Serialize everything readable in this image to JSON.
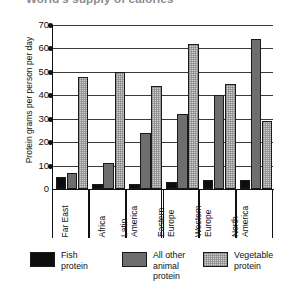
{
  "chart_data": {
    "type": "bar",
    "title": "World's supply of calories",
    "xlabel": "",
    "ylabel": "Protein grams per person per day",
    "ylim": [
      0,
      70
    ],
    "yticks": [
      0,
      10,
      20,
      30,
      40,
      50,
      60,
      70
    ],
    "grid": true,
    "legend_position": "bottom",
    "categories": [
      "Far East",
      "Africa",
      "Latin America",
      "Eastern Europe",
      "Western Europe",
      "North America"
    ],
    "category_lines": [
      [
        "Far East"
      ],
      [
        "Africa"
      ],
      [
        "Latin",
        "America"
      ],
      [
        "Eastern",
        "Europe"
      ],
      [
        "Western",
        "Europe"
      ],
      [
        "North",
        "America"
      ]
    ],
    "series": [
      {
        "name": "Fish protein",
        "name_lines": [
          "Fish",
          "protein"
        ],
        "color": "#0d0d0d",
        "values": [
          5,
          2,
          2,
          3,
          4,
          4
        ]
      },
      {
        "name": "All other animal protein",
        "name_lines": [
          "All other",
          "animal",
          "protein"
        ],
        "color": "#6e6e6e",
        "values": [
          7,
          11,
          24,
          32,
          40,
          64
        ]
      },
      {
        "name": "Vegetable protein",
        "name_lines": [
          "Vegetable",
          "protein"
        ],
        "color": "#cfcfcf",
        "values": [
          48,
          50,
          44,
          62,
          45,
          29
        ]
      }
    ]
  }
}
